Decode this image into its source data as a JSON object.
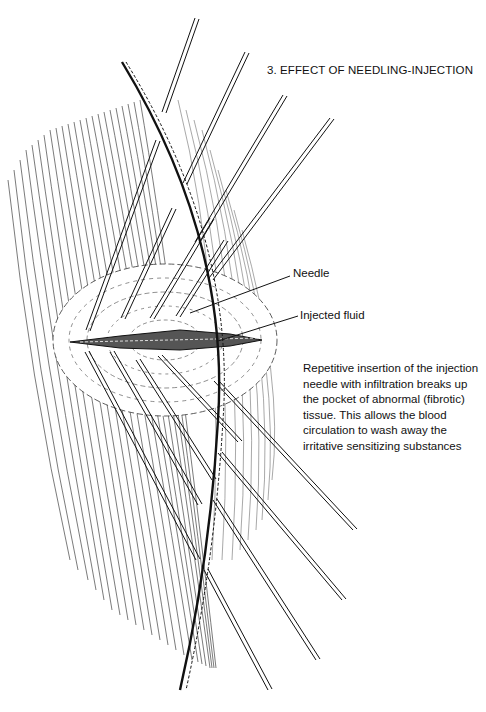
{
  "figure": {
    "title": "3. EFFECT OF NEEDLING-INJECTION",
    "labels": {
      "needle": "Needle",
      "injected_fluid": "Injected fluid"
    },
    "caption": {
      "lines": [
        "Repetitive insertion of the injection",
        "needle with infiltration breaks up",
        "the pocket of abnormal (fibrotic)",
        "tissue.  This allows the blood",
        "circulation to wash away the",
        "irritative sensitizing substances"
      ]
    },
    "colors": {
      "ink": "#111111",
      "background": "#ffffff"
    }
  }
}
